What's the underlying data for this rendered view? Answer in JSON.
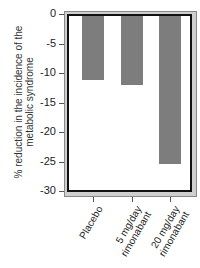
{
  "chart_data": {
    "type": "bar",
    "title": "",
    "xlabel": "",
    "ylabel": "% reduction in the incidence of the metabolic syndrome",
    "ylabel_lines": [
      "% reduction in the incidence of the",
      "metabolic syndrome"
    ],
    "categories": [
      "Placebo",
      "5 mg/day rimonabant",
      "20 mg/day rimonabant"
    ],
    "category_lines": [
      [
        "Placebo"
      ],
      [
        "5 mg/day",
        "rimonabant"
      ],
      [
        "20 mg/day",
        "rimonabant"
      ]
    ],
    "values": [
      -11.2,
      -12.0,
      -25.4
    ],
    "ylim": [
      -30,
      0
    ],
    "yticks": [
      0,
      -5,
      -10,
      -15,
      -20,
      -25,
      -30
    ],
    "ytick_labels": [
      "0",
      "-5",
      "-10",
      "-15",
      "-20",
      "-25",
      "-30"
    ],
    "grid": false,
    "legend": null,
    "bar_color": "#7d7d7d"
  }
}
